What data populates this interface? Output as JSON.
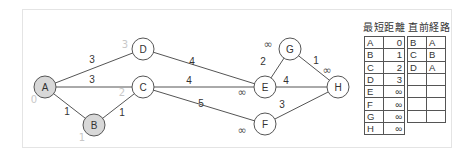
{
  "graph": {
    "nodes": [
      {
        "id": "A",
        "x": 45,
        "y": 87,
        "visited": true,
        "dist": "0",
        "dist_x": 34,
        "dist_y": 103
      },
      {
        "id": "B",
        "x": 94,
        "y": 125,
        "visited": true,
        "dist": "1",
        "dist_x": 82,
        "dist_y": 141
      },
      {
        "id": "C",
        "x": 143,
        "y": 87,
        "visited": false,
        "dist": "2",
        "dist_x": 122,
        "dist_y": 96
      },
      {
        "id": "D",
        "x": 143,
        "y": 49,
        "visited": false,
        "dist": "3",
        "dist_x": 125,
        "dist_y": 48
      },
      {
        "id": "E",
        "x": 265,
        "y": 87,
        "visited": false,
        "dist": "∞",
        "dist_x": 242,
        "dist_y": 96
      },
      {
        "id": "F",
        "x": 265,
        "y": 124,
        "visited": false,
        "dist": "∞",
        "dist_x": 242,
        "dist_y": 134
      },
      {
        "id": "G",
        "x": 290,
        "y": 49,
        "visited": false,
        "dist": "∞",
        "dist_x": 268,
        "dist_y": 48
      },
      {
        "id": "H",
        "x": 338,
        "y": 87,
        "visited": false,
        "dist": "∞",
        "dist_x": 327,
        "dist_y": 74
      }
    ],
    "edges": [
      {
        "from": "A",
        "to": "D",
        "weight": "3",
        "lx": 92,
        "ly": 63
      },
      {
        "from": "A",
        "to": "C",
        "weight": "3",
        "lx": 92,
        "ly": 83
      },
      {
        "from": "A",
        "to": "B",
        "weight": "1",
        "lx": 67,
        "ly": 115
      },
      {
        "from": "B",
        "to": "C",
        "weight": "1",
        "lx": 122,
        "ly": 116
      },
      {
        "from": "D",
        "to": "E",
        "weight": "4",
        "lx": 192,
        "ly": 65
      },
      {
        "from": "C",
        "to": "E",
        "weight": "4",
        "lx": 189,
        "ly": 84
      },
      {
        "from": "C",
        "to": "F",
        "weight": "5",
        "lx": 201,
        "ly": 107
      },
      {
        "from": "E",
        "to": "G",
        "weight": "2",
        "lx": 263,
        "ly": 65
      },
      {
        "from": "E",
        "to": "H",
        "weight": "4",
        "lx": 286,
        "ly": 84
      },
      {
        "from": "G",
        "to": "H",
        "weight": "1",
        "lx": 316,
        "ly": 64
      },
      {
        "from": "F",
        "to": "H",
        "weight": "3",
        "lx": 282,
        "ly": 108
      }
    ],
    "colors": {
      "visited_fill": "#d8d8d8",
      "node_fill": "#ffffff",
      "stroke": "#555555",
      "dist_visited": "#c8c8c8",
      "dist_unvisited": "#555555",
      "label": "#333333"
    }
  },
  "tables": {
    "shortest_distance": {
      "title": "最短距離",
      "rows": [
        {
          "node": "A",
          "value": "0"
        },
        {
          "node": "B",
          "value": "1"
        },
        {
          "node": "C",
          "value": "2"
        },
        {
          "node": "D",
          "value": "3"
        },
        {
          "node": "E",
          "value": "∞"
        },
        {
          "node": "F",
          "value": "∞"
        },
        {
          "node": "G",
          "value": "∞"
        },
        {
          "node": "H",
          "value": "∞"
        }
      ]
    },
    "previous_route": {
      "title": "直前経路",
      "rows": [
        {
          "node": "B",
          "prev": "A"
        },
        {
          "node": "C",
          "prev": "B"
        },
        {
          "node": "D",
          "prev": "A"
        },
        {
          "node": "",
          "prev": ""
        },
        {
          "node": "",
          "prev": ""
        },
        {
          "node": "",
          "prev": ""
        },
        {
          "node": "",
          "prev": ""
        }
      ]
    }
  }
}
